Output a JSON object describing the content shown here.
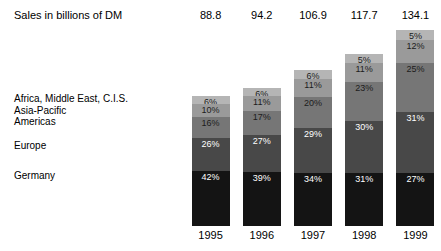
{
  "header": {
    "row_label": "Sales in billions of DM"
  },
  "chart_data": {
    "type": "bar",
    "subtype": "stacked-percentage",
    "title": "Sales in billions of DM",
    "xlabel": "",
    "ylabel": "",
    "grid": false,
    "legend_position": "left",
    "categories": [
      "1995",
      "1996",
      "1997",
      "1998",
      "1999"
    ],
    "totals_label": "Sales in billions of DM",
    "totals": [
      "88.8",
      "94.2",
      "106.9",
      "117.7",
      "134.1"
    ],
    "totals_numeric": [
      88.8,
      94.2,
      106.9,
      117.7,
      134.1
    ],
    "stack_order_top_to_bottom": [
      "Africa, Middle East, C.I.S.",
      "Asia-Pacific",
      "Americas",
      "Europe",
      "Germany"
    ],
    "series": [
      {
        "name": "Africa, Middle East, C.I.S.",
        "color": "#b5b5b5",
        "label_color": "dark",
        "values": [
          6,
          6,
          6,
          5,
          5
        ],
        "labels": [
          "6%",
          "6%",
          "6%",
          "5%",
          "5%"
        ]
      },
      {
        "name": "Asia-Pacific",
        "color": "#9a9a9a",
        "label_color": "dark",
        "values": [
          10,
          11,
          11,
          11,
          12
        ],
        "labels": [
          "10%",
          "11%",
          "11%",
          "11%",
          "12%"
        ]
      },
      {
        "name": "Americas",
        "color": "#767676",
        "label_color": "dark",
        "values": [
          16,
          17,
          20,
          23,
          25
        ],
        "labels": [
          "16%",
          "17%",
          "20%",
          "23%",
          "25%"
        ]
      },
      {
        "name": "Europe",
        "color": "#484848",
        "label_color": "light",
        "values": [
          26,
          27,
          29,
          30,
          31
        ],
        "labels": [
          "26%",
          "27%",
          "29%",
          "30%",
          "31%"
        ]
      },
      {
        "name": "Germany",
        "color": "#141414",
        "label_color": "light",
        "values": [
          42,
          39,
          34,
          31,
          27
        ],
        "labels": [
          "42%",
          "39%",
          "34%",
          "31%",
          "27%"
        ]
      }
    ]
  },
  "legend": {
    "items": [
      {
        "label": "Africa, Middle East, C.I.S.",
        "top": 93
      },
      {
        "label": "Asia-Pacific",
        "top": 105
      },
      {
        "label": "Americas",
        "top": 116
      },
      {
        "label": "Europe",
        "top": 140
      },
      {
        "label": "Germany",
        "top": 170
      }
    ]
  },
  "colors": {
    "background": "#ffffff",
    "text": "#000000",
    "segment_lightest": "#b5b5b5",
    "segment_light": "#9a9a9a",
    "segment_mid": "#767676",
    "segment_dark": "#484848",
    "segment_darkest": "#141414"
  }
}
